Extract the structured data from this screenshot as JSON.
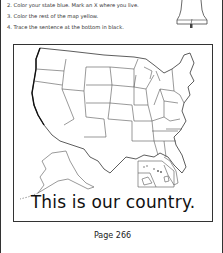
{
  "instructions": [
    "2. Color your state blue. Mark an X where you live.",
    "3. Color the rest of the map yellow.",
    "4. Trace the sentence at the bottom in black."
  ],
  "icons": {
    "bell": "liberty-bell-icon",
    "map": "us-map-outline"
  },
  "map": {
    "title": "United States map with Alaska and Hawaii insets",
    "sentence": "This is our country."
  },
  "footer": {
    "page_label": "Page 266"
  }
}
